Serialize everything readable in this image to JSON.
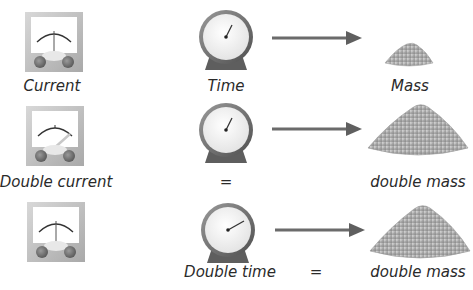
{
  "diagram": {
    "rows": [
      {
        "meter_label": "Current",
        "meter_needle": "center",
        "clock_label": "Time",
        "clock_hand": "short",
        "equals": "",
        "mass_label": "Mass",
        "mass_size": "small"
      },
      {
        "meter_label": "Double current",
        "meter_needle": "right",
        "clock_label": "=",
        "clock_hand": "short",
        "equals": "",
        "mass_label": "double mass",
        "mass_size": "large"
      },
      {
        "meter_label": "",
        "meter_needle": "center",
        "clock_label": "Double time",
        "clock_hand": "long",
        "equals": "=",
        "mass_label": "double mass",
        "mass_size": "large"
      }
    ],
    "icons": {
      "meter": "ammeter-icon",
      "clock": "clock-icon",
      "arrow": "arrow-right-icon",
      "mass": "powder-mound-icon"
    },
    "colors": {
      "text": "#2a2a2a",
      "arrow": "#6b6b6b",
      "meter_frame": "#c9c9c9",
      "clock_rim": "#707070",
      "mound": "#b5b5b5"
    }
  }
}
